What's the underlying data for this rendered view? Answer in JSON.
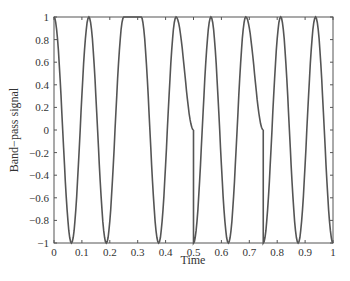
{
  "chart_data": {
    "type": "line",
    "title": "",
    "xlabel": "Time",
    "ylabel": "Band−pass signal",
    "xlim": [
      0,
      1
    ],
    "ylim": [
      -1,
      1
    ],
    "xticks": [
      "0",
      "0.1",
      "0.2",
      "0.3",
      "0.4",
      "0.5",
      "0.6",
      "0.7",
      "0.8",
      "0.9",
      "1"
    ],
    "yticks": [
      "−1",
      "−0.8",
      "−0.6",
      "−0.4",
      "−0.2",
      "0",
      "0.2",
      "0.4",
      "0.6",
      "0.8",
      "1"
    ],
    "grid": false,
    "series": [
      {
        "name": "band-pass signal",
        "description": "cosine oscillation ~8 cycles, phase discontinuities near t=0.5 and t=0.75",
        "x": [
          0,
          0.0625,
          0.125,
          0.1875,
          0.25,
          0.3125,
          0.375,
          0.4375,
          0.5,
          0.5,
          0.5625,
          0.625,
          0.6875,
          0.75,
          0.75,
          0.8125,
          0.875,
          0.9375,
          1
        ],
        "y": [
          1,
          -1,
          1,
          -1,
          1,
          1,
          -1,
          1,
          0,
          -1,
          1,
          -1,
          1,
          0,
          -1,
          1,
          -1,
          1,
          -1
        ]
      }
    ]
  }
}
